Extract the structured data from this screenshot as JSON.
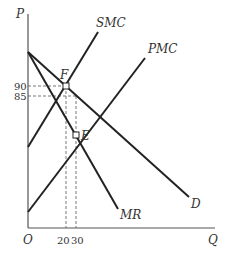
{
  "axes": {
    "y_label": "P",
    "x_label": "Q",
    "origin_label": "O"
  },
  "y_ticks": [
    {
      "label": "90",
      "y": 86
    },
    {
      "label": "85",
      "y": 96
    }
  ],
  "x_ticks": [
    {
      "label": "20",
      "x": 66
    },
    {
      "label": "30",
      "x": 76
    }
  ],
  "curves": {
    "smc": {
      "label": "SMC"
    },
    "pmc": {
      "label": "PMC"
    },
    "demand": {
      "label": "D"
    },
    "mr": {
      "label": "MR"
    }
  },
  "points": {
    "F": {
      "label": "F",
      "q": 20,
      "p": 90
    },
    "E": {
      "label": "E",
      "q": 30,
      "p": 85
    }
  },
  "colors": {
    "line": "#222222",
    "axis": "#555555",
    "dashed": "#666666"
  }
}
